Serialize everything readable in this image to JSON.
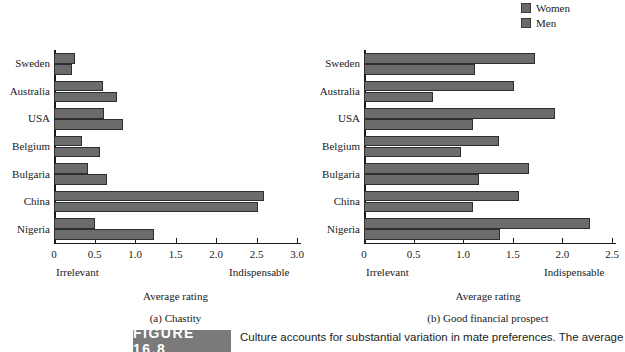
{
  "legend": {
    "items": [
      {
        "label": "Women",
        "color": "#6b6b6b"
      },
      {
        "label": "Men",
        "color": "#6b6b6b"
      }
    ]
  },
  "figure": {
    "tag": "FIGURE 16.8",
    "caption": "Culture accounts for substantial variation in mate preferences. The average"
  },
  "chart_data": [
    {
      "type": "bar",
      "orientation": "horizontal",
      "title": "",
      "panel_caption": "(a) Chastity",
      "categories": [
        "Sweden",
        "Australia",
        "USA",
        "Belgium",
        "Bulgaria",
        "China",
        "Nigeria"
      ],
      "series": [
        {
          "name": "Women",
          "values": [
            0.26,
            0.6,
            0.62,
            0.35,
            0.42,
            2.59,
            0.5
          ]
        },
        {
          "name": "Men",
          "values": [
            0.22,
            0.78,
            0.85,
            0.57,
            0.66,
            2.52,
            1.23
          ]
        }
      ],
      "xlabel": "Average rating",
      "ylabel": "",
      "xlim": [
        0,
        3.0
      ],
      "xticks": [
        0,
        0.5,
        1.0,
        1.5,
        2.0,
        2.5,
        3.0
      ],
      "xticklabels": [
        "0",
        "0.5",
        "1.0",
        "1.5",
        "2.0",
        "2.5",
        "3.0"
      ],
      "anchor_low": "Irrelevant",
      "anchor_high": "Indispensable",
      "grid": false,
      "legend_position": "top-right"
    },
    {
      "type": "bar",
      "orientation": "horizontal",
      "title": "",
      "panel_caption": "(b) Good financial prospect",
      "categories": [
        "Sweden",
        "Australia",
        "USA",
        "Belgium",
        "Bulgaria",
        "China",
        "Nigeria"
      ],
      "series": [
        {
          "name": "Women",
          "values": [
            1.72,
            1.51,
            1.93,
            1.36,
            1.66,
            1.56,
            2.28
          ]
        },
        {
          "name": "Men",
          "values": [
            1.12,
            0.7,
            1.1,
            0.98,
            1.16,
            1.1,
            1.37
          ]
        }
      ],
      "xlabel": "Average rating",
      "ylabel": "",
      "xlim": [
        0,
        2.5
      ],
      "xticks": [
        0,
        0.5,
        1.0,
        1.5,
        2.0,
        2.5
      ],
      "xticklabels": [
        "0",
        "0.5",
        "1.0",
        "1.5",
        "2.0",
        "2.5"
      ],
      "anchor_low": "Irrelevant",
      "anchor_high": "Indispensable",
      "grid": false,
      "legend_position": "top-right"
    }
  ]
}
